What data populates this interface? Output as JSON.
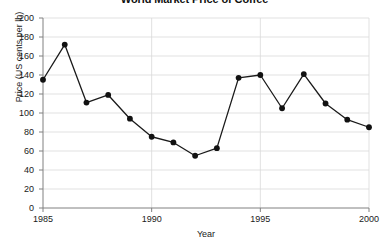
{
  "chart_data": {
    "type": "line",
    "title": "World Market Price of Coffee",
    "xlabel": "Year",
    "ylabel": "Price (US cents per lb)",
    "x": [
      1985,
      1986,
      1987,
      1988,
      1989,
      1990,
      1991,
      1992,
      1993,
      1994,
      1995,
      1996,
      1997,
      1998,
      1999,
      2000
    ],
    "values": [
      135,
      172,
      111,
      119,
      94,
      75,
      69,
      55,
      63,
      137,
      140,
      105,
      141,
      110,
      93,
      85
    ],
    "series": [
      {
        "name": "World market price of coffee",
        "values": [
          135,
          172,
          111,
          119,
          94,
          75,
          69,
          55,
          63,
          137,
          140,
          105,
          141,
          110,
          93,
          85
        ]
      }
    ],
    "xlim": [
      1985,
      2000
    ],
    "ylim": [
      0,
      200
    ],
    "ytick_labels": [
      "200",
      "180",
      "160",
      "140",
      "120",
      "100",
      "80",
      "60",
      "40",
      "20",
      "0"
    ],
    "ytick_values": [
      200,
      180,
      160,
      140,
      120,
      100,
      80,
      60,
      40,
      20,
      0
    ],
    "xtick_labels": [
      "1985",
      "1990",
      "1995",
      "2000"
    ],
    "xtick_values": [
      1985,
      1990,
      1995,
      2000
    ],
    "grid": true,
    "legend": "none",
    "marker": "circle",
    "line_color": "#1a1a1a",
    "marker_color": "#111111",
    "grid_color": "#d9d9d9",
    "axis_color": "#808080",
    "background": "#ffffff"
  }
}
